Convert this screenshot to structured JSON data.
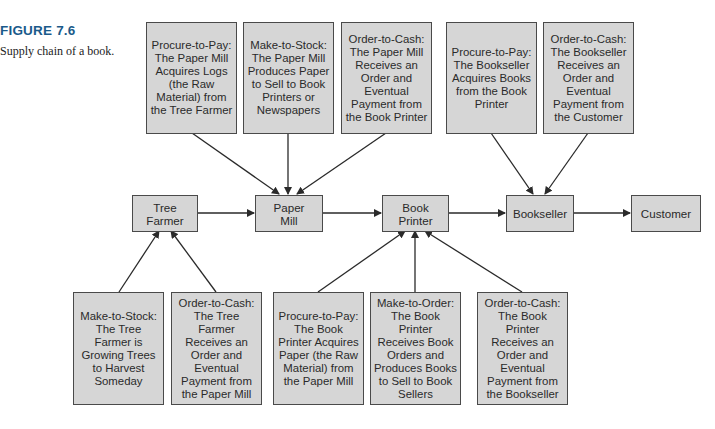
{
  "figure": {
    "label": "FIGURE 7.6",
    "caption": "Supply chain of a book."
  },
  "chain_nodes": [
    {
      "id": "tree-farmer",
      "label": "Tree\nFarmer"
    },
    {
      "id": "paper-mill",
      "label": "Paper\nMill"
    },
    {
      "id": "book-printer",
      "label": "Book\nPrinter"
    },
    {
      "id": "bookseller",
      "label": "Bookseller"
    },
    {
      "id": "customer",
      "label": "Customer"
    }
  ],
  "process_boxes_top": [
    {
      "target": "paper-mill",
      "text": "Procure-to-Pay: The Paper Mill Acquires Logs (the Raw Material) from the Tree Farmer"
    },
    {
      "target": "paper-mill",
      "text": "Make-to-Stock: The Paper Mill Produces Paper to Sell to Book Printers or Newspapers"
    },
    {
      "target": "paper-mill",
      "text": "Order-to-Cash: The Paper Mill Receives an Order and Eventual Payment from the Book Printer"
    },
    {
      "target": "bookseller",
      "text": "Procure-to-Pay: The Bookseller Acquires Books from the Book Printer"
    },
    {
      "target": "bookseller",
      "text": "Order-to-Cash: The Bookseller Receives an Order and Eventual Payment from the Customer"
    }
  ],
  "process_boxes_bottom": [
    {
      "target": "tree-farmer",
      "text": "Make-to-Stock: The Tree Farmer is Growing Trees to Harvest Someday"
    },
    {
      "target": "tree-farmer",
      "text": "Order-to-Cash: The Tree Farmer Receives an Order and Eventual Payment from the Paper Mill"
    },
    {
      "target": "book-printer",
      "text": "Procure-to-Pay: The Book Printer Acquires Paper (the Raw Material) from the Paper Mill"
    },
    {
      "target": "book-printer",
      "text": "Make-to-Order: The Book Printer Receives Book Orders and Produces Books to Sell to Book Sellers"
    },
    {
      "target": "book-printer",
      "text": "Order-to-Cash: The Book Printer Receives an Order and Eventual Payment from the Bookseller"
    }
  ],
  "colors": {
    "figure_label": "#1a5a8a",
    "box_fill": "#d6d6d6",
    "box_border": "#4a4a4a",
    "arrow": "#2a2a2a"
  }
}
